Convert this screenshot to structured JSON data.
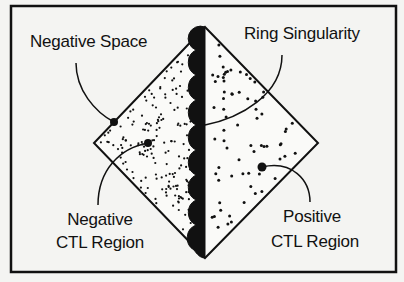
{
  "diagram": {
    "type": "penrose-style causal diagram",
    "colors": {
      "background": "#f4f4f2",
      "ink": "#111111"
    },
    "labels": {
      "negative_space": "Negative Space",
      "ring_singularity": "Ring Singularity",
      "negative_ctl_line1": "Negative",
      "negative_ctl_line2": "CTL Region",
      "positive_ctl_line1": "Positive",
      "positive_ctl_line2": "CTL Region"
    },
    "regions": [
      {
        "name": "Negative CTL Region",
        "side": "left",
        "fill": "dense-dots"
      },
      {
        "name": "Positive CTL Region",
        "side": "right",
        "fill": "sparse-dots"
      }
    ],
    "boundary": {
      "name": "Ring Singularity",
      "style": "scalloped-black-band"
    }
  }
}
